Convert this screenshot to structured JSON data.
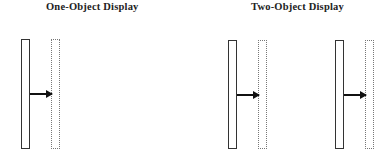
{
  "panels": [
    {
      "title": "One-Object Display",
      "objects": [
        {
          "solid": {
            "x": 21,
            "y": 39,
            "w": 9,
            "h": 110
          },
          "dotted": {
            "x": 51,
            "y": 39,
            "w": 9,
            "h": 110
          },
          "arrow": {
            "x": 30,
            "y": 93,
            "len": 22
          }
        }
      ]
    },
    {
      "title": "Two-Object Display",
      "objects": [
        {
          "solid": {
            "x": 228,
            "y": 40,
            "w": 9,
            "h": 109
          },
          "dotted": {
            "x": 258,
            "y": 40,
            "w": 9,
            "h": 109
          },
          "arrow": {
            "x": 237,
            "y": 94,
            "len": 22
          }
        },
        {
          "solid": {
            "x": 335,
            "y": 40,
            "w": 9,
            "h": 109
          },
          "dotted": {
            "x": 365,
            "y": 40,
            "w": 9,
            "h": 109
          },
          "arrow": {
            "x": 344,
            "y": 94,
            "len": 22
          }
        }
      ]
    }
  ],
  "colors": {
    "line": "#333333",
    "dotted": "#777777",
    "arrow": "#111111"
  }
}
